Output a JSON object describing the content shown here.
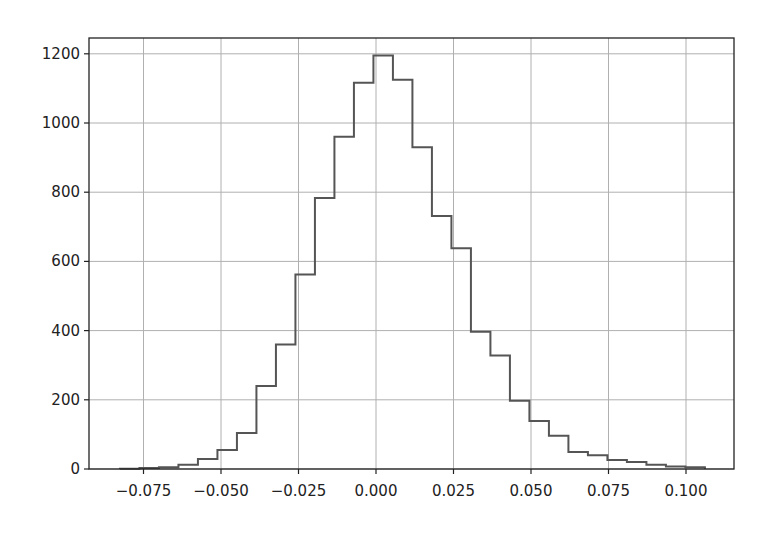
{
  "chart_data": {
    "type": "bar",
    "subtype": "histogram-step",
    "title": "",
    "xlabel": "",
    "ylabel": "",
    "xlim": [
      -0.088,
      0.115
    ],
    "ylim": [
      0,
      1250
    ],
    "grid": true,
    "legend": null,
    "xticks": [
      -0.075,
      -0.05,
      -0.025,
      0.0,
      0.025,
      0.05,
      0.075,
      0.1
    ],
    "xtick_labels": [
      "−0.075",
      "−0.050",
      "−0.025",
      "0.000",
      "0.025",
      "0.050",
      "0.075",
      "0.100"
    ],
    "yticks": [
      0,
      200,
      400,
      600,
      800,
      1000,
      1200
    ],
    "ytick_labels": [
      "0",
      "200",
      "400",
      "600",
      "800",
      "1000",
      "1200"
    ],
    "bin_start": -0.0826,
    "bin_width": 0.00629,
    "values": [
      1,
      3,
      5,
      12,
      29,
      55,
      104,
      240,
      360,
      562,
      783,
      960,
      1116,
      1195,
      1125,
      930,
      731,
      638,
      397,
      328,
      197,
      139,
      96,
      49,
      40,
      26,
      20,
      12,
      7,
      5
    ],
    "line_color": "#555555",
    "grid_color": "#b0b0b0",
    "frame_color": "#222222"
  }
}
